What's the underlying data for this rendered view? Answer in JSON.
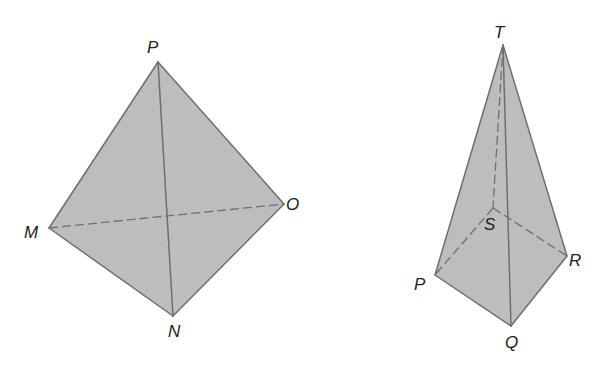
{
  "figures": [
    {
      "name": "tetrahedron",
      "vertices": {
        "P": {
          "label": "P",
          "x": 158,
          "y": 62
        },
        "M": {
          "label": "M",
          "x": 49,
          "y": 228
        },
        "O": {
          "label": "O",
          "x": 284,
          "y": 204
        },
        "N": {
          "label": "N",
          "x": 173,
          "y": 316
        }
      },
      "visible_edges": [
        "PM",
        "PO",
        "MN",
        "NO",
        "PN"
      ],
      "hidden_edges": [
        "MO"
      ]
    },
    {
      "name": "square-pyramid",
      "vertices": {
        "T": {
          "label": "T",
          "x": 503,
          "y": 45
        },
        "S": {
          "label": "S",
          "x": 493,
          "y": 208
        },
        "P": {
          "label": "P",
          "x": 435,
          "y": 275
        },
        "R": {
          "label": "R",
          "x": 567,
          "y": 256
        },
        "Q": {
          "label": "Q",
          "x": 511,
          "y": 326
        }
      },
      "visible_edges": [
        "TP",
        "TR",
        "TQ",
        "PQ",
        "QR"
      ],
      "hidden_edges": [
        "TS",
        "SP",
        "SR"
      ]
    }
  ],
  "labels": {
    "tetra_P": "P",
    "tetra_M": "M",
    "tetra_O": "O",
    "tetra_N": "N",
    "pyr_T": "T",
    "pyr_S": "S",
    "pyr_P": "P",
    "pyr_R": "R",
    "pyr_Q": "Q"
  },
  "colors": {
    "fill": "#bdbdbd",
    "edge": "#6e6e6e",
    "label": "#222222",
    "background": "#ffffff"
  }
}
